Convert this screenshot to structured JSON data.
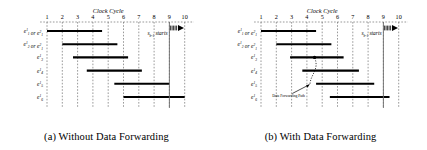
{
  "figure": {
    "axis_title": "Clock Cycle",
    "tick_labels": [
      "1",
      "2",
      "3",
      "4",
      "5",
      "6",
      "7",
      "8",
      "9",
      "10"
    ],
    "colors": {
      "bar": "#000000",
      "grid": "#555555",
      "marker_line": "#6b6b6b",
      "background": "#ffffff"
    }
  },
  "chart_data": {
    "type": "bar",
    "xlabel": "Clock Cycle",
    "ylabel": "",
    "xlim": [
      0.5,
      10.5
    ],
    "grid": true,
    "legend": "none",
    "panels": [
      {
        "id": "a",
        "caption": "(a) Without Data Forwarding",
        "categories": [
          "e_1^1 or e_1^2",
          "e_2^1 or e_1^2",
          "e_3^1",
          "e_4^1",
          "e_5^1",
          "e_6^1"
        ],
        "bars": [
          {
            "label": "e_1^1 or e_1^2",
            "start": 1.0,
            "end": 4.6
          },
          {
            "label": "e_2^1 or e_1^2",
            "start": 2.0,
            "end": 5.6
          },
          {
            "label": "e_3^1",
            "start": 2.7,
            "end": 6.3
          },
          {
            "label": "e_4^1",
            "start": 3.6,
            "end": 7.2
          },
          {
            "label": "e_5^1",
            "start": 5.4,
            "end": 9.0
          },
          {
            "label": "e_6^1",
            "start": 6.0,
            "end": 10.0
          }
        ],
        "markers": [
          {
            "name": "s_{b-1} starts",
            "cycle": 9.0,
            "label_main": "s",
            "label_sub": "b-1",
            "label_text": "starts"
          }
        ],
        "annotations": []
      },
      {
        "id": "b",
        "caption": "(b) With Data Forwarding",
        "categories": [
          "e_1^1 or e_1^2",
          "e_2^1 or e_1^2",
          "e_3^1",
          "e_4^1",
          "e_5^1",
          "e_6^1"
        ],
        "bars": [
          {
            "label": "e_1^1 or e_1^2",
            "start": 1.0,
            "end": 4.6
          },
          {
            "label": "e_2^1 or e_1^2",
            "start": 2.0,
            "end": 5.6
          },
          {
            "label": "e_3^1",
            "start": 2.9,
            "end": 6.4
          },
          {
            "label": "e_4^1",
            "start": 3.7,
            "end": 7.4
          },
          {
            "label": "e_5^1",
            "start": 4.6,
            "end": 8.4
          },
          {
            "label": "e_6^1",
            "start": 5.5,
            "end": 9.4
          }
        ],
        "markers": [
          {
            "name": "s_{b-1} starts",
            "cycle": 9.0,
            "label_main": "s",
            "label_sub": "b-1",
            "label_text": "starts"
          }
        ],
        "annotations": [
          {
            "name": "data-forwarding-path",
            "text": "Data Forwarding Path",
            "from_cycle": 4.2,
            "from_row": 4,
            "to_cycle": 4.5,
            "to_row": 2
          }
        ]
      }
    ]
  }
}
